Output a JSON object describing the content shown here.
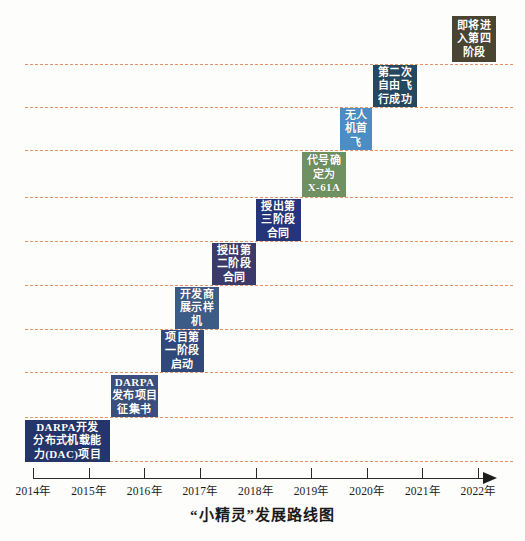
{
  "chart_data": {
    "type": "bar",
    "title": "“小精灵”发展路线图",
    "xlabel": "",
    "ylabel": "",
    "grid": true,
    "legend": "none",
    "axis": {
      "ticks": [
        "2014年",
        "2015年",
        "2016年",
        "2017年",
        "2018年",
        "2019年",
        "2020年",
        "2021年",
        "2022年"
      ],
      "tick_values": [
        2014,
        2015,
        2016,
        2017,
        2018,
        2019,
        2020,
        2021,
        2022
      ],
      "xlim": [
        2014,
        2022
      ],
      "arrow": true
    },
    "categories": [
      "DARPA开发分布式机载能力(DAC)项目",
      "DARPA发布项目征集书",
      "项目第一阶段启动",
      "开发商展示样机",
      "授出第二阶段合同",
      "授出第三阶段合同",
      "代号确定为X-61A",
      "无人机首飞",
      "第二次自由飞行成功",
      "即将进入第四阶段"
    ],
    "values": [
      1,
      2,
      3,
      4,
      5,
      6,
      7,
      8,
      9,
      10
    ],
    "milestones": [
      {
        "lines": [
          "DARPA开发",
          "分布式机载能",
          "力(DAC)项目"
        ],
        "year_start": 2014.0,
        "year_end": 2015.5,
        "step": 1,
        "color": "#24356b",
        "x": 25,
        "y": 420,
        "w": 85,
        "h": 42
      },
      {
        "lines": [
          "DARPA",
          "发布项目",
          "征集书"
        ],
        "year_start": 2015.4,
        "year_end": 2016.3,
        "step": 2,
        "color": "#3a4f7e",
        "x": 111,
        "y": 375,
        "w": 47,
        "h": 42
      },
      {
        "lines": [
          "项目第",
          "一阶段",
          "启动"
        ],
        "year_start": 2016.3,
        "year_end": 2017.0,
        "step": 3,
        "color": "#31487a",
        "x": 161,
        "y": 330,
        "w": 43,
        "h": 42
      },
      {
        "lines": [
          "开发商",
          "展示样",
          "机"
        ],
        "year_start": 2017.0,
        "year_end": 2017.7,
        "step": 4,
        "color": "#3d5b87",
        "x": 175,
        "y": 287,
        "w": 44,
        "h": 42
      },
      {
        "lines": [
          "授出第",
          "二阶段",
          "合同"
        ],
        "year_start": 2017.7,
        "year_end": 2018.4,
        "step": 5,
        "color": "#3c3a6b",
        "x": 212,
        "y": 243,
        "w": 44,
        "h": 42
      },
      {
        "lines": [
          "授出第",
          "三阶段",
          "合同"
        ],
        "year_start": 2018.4,
        "year_end": 2019.1,
        "step": 6,
        "color": "#25357a",
        "x": 256,
        "y": 199,
        "w": 45,
        "h": 42
      },
      {
        "lines": [
          "代号确",
          "定为",
          "X-61A"
        ],
        "year_start": 2019.1,
        "year_end": 2019.8,
        "step": 7,
        "color": "#6f9060",
        "x": 302,
        "y": 152,
        "w": 44,
        "h": 45
      },
      {
        "lines": [
          "无人",
          "机首",
          "飞"
        ],
        "year_start": 2019.8,
        "year_end": 2020.3,
        "step": 8,
        "color": "#4b8dc4",
        "x": 340,
        "y": 108,
        "w": 32,
        "h": 42
      },
      {
        "lines": [
          "第二次",
          "自由飞",
          "行成功"
        ],
        "year_start": 2020.3,
        "year_end": 2021.0,
        "step": 9,
        "color": "#25475f",
        "x": 373,
        "y": 65,
        "w": 44,
        "h": 42
      },
      {
        "lines": [
          "即将进",
          "入第四",
          "阶段"
        ],
        "year_start": 2021.6,
        "year_end": 2022.3,
        "step": 10,
        "color": "#4a4432",
        "x": 452,
        "y": 16,
        "w": 44,
        "h": 46
      }
    ],
    "gridlines_y": [
      64,
      107,
      150,
      197,
      241,
      285,
      329,
      372,
      417,
      461
    ],
    "gridline_color": "#e0814e"
  }
}
